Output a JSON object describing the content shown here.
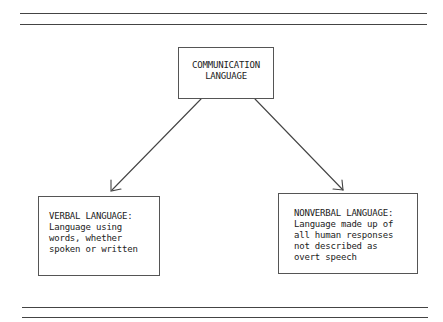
{
  "diagram": {
    "root": {
      "lines": [
        "COMMUNICATION",
        "LANGUAGE"
      ]
    },
    "children": [
      {
        "id": "verbal",
        "lines": [
          "VERBAL LANGUAGE:",
          "Language using",
          "words, whether",
          "spoken or written"
        ]
      },
      {
        "id": "nonverbal",
        "lines": [
          "NONVERBAL LANGUAGE:",
          "Language made up of",
          "all human responses",
          "not described as",
          "overt speech"
        ]
      }
    ],
    "edges": [
      {
        "from": "root",
        "to": "verbal",
        "arrow": "end"
      },
      {
        "from": "root",
        "to": "nonverbal",
        "arrow": "end"
      }
    ],
    "colors": {
      "line": "#444444",
      "text": "#222222",
      "background": "#ffffff"
    }
  }
}
